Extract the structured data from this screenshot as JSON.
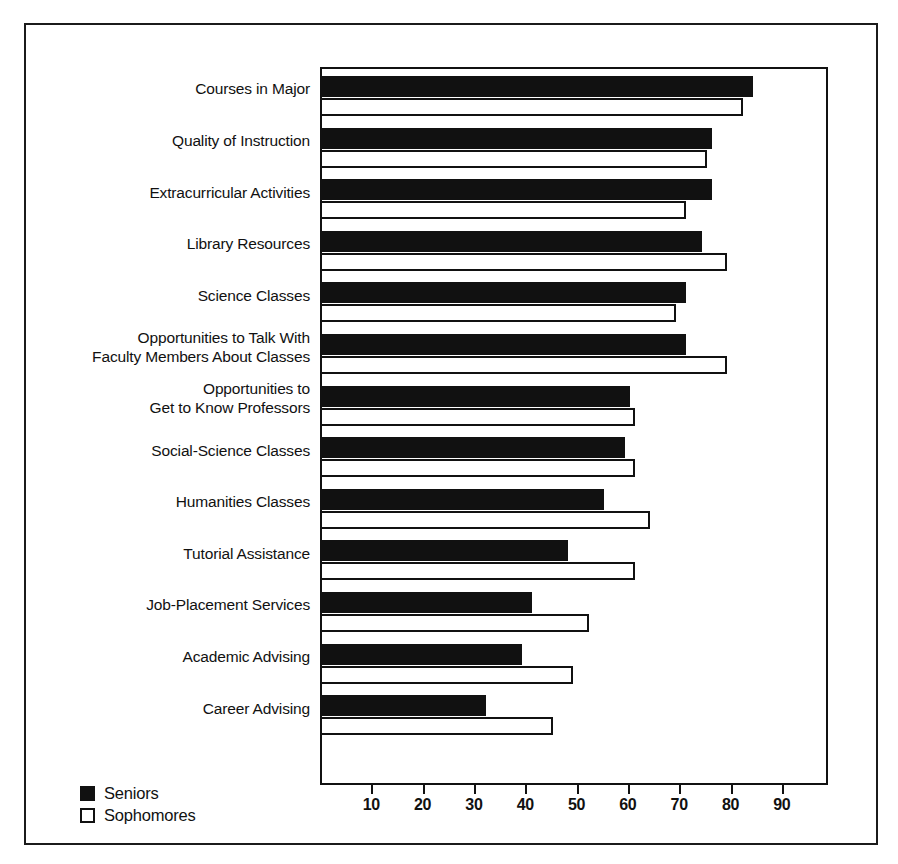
{
  "chart_data": {
    "type": "bar",
    "orientation": "horizontal",
    "title": "",
    "xlabel": "",
    "ylabel": "",
    "xlim": [
      0,
      99
    ],
    "grid": false,
    "legend_position": "bottom-left",
    "categories": [
      "Courses in Major",
      "Quality of Instruction",
      "Extracurricular Activities",
      "Library Resources",
      "Science Classes",
      "Opportunities to Talk With\nFaculty Members About Classes",
      "Opportunities to\nGet to Know Professors",
      "Social-Science Classes",
      "Humanities Classes",
      "Tutorial Assistance",
      "Job-Placement Services",
      "Academic Advising",
      "Career Advising"
    ],
    "series": [
      {
        "name": "Seniors",
        "color": "#111111",
        "style": "filled",
        "values": [
          84,
          76,
          76,
          74,
          71,
          71,
          60,
          59,
          55,
          48,
          41,
          39,
          32
        ]
      },
      {
        "name": "Sophomores",
        "color": "#ffffff",
        "style": "hollow",
        "values": [
          82,
          75,
          71,
          79,
          69,
          79,
          61,
          61,
          64,
          61,
          52,
          49,
          45
        ]
      }
    ],
    "xticks": [
      10,
      20,
      30,
      40,
      50,
      60,
      70,
      80,
      90
    ],
    "xticklabels": [
      "10",
      "20",
      "30",
      "40",
      "50",
      "60",
      "70",
      "80",
      "90"
    ]
  },
  "legend": {
    "items": [
      {
        "label": "Seniors",
        "style": "filled"
      },
      {
        "label": "Sophomores",
        "style": "hollow"
      }
    ]
  }
}
